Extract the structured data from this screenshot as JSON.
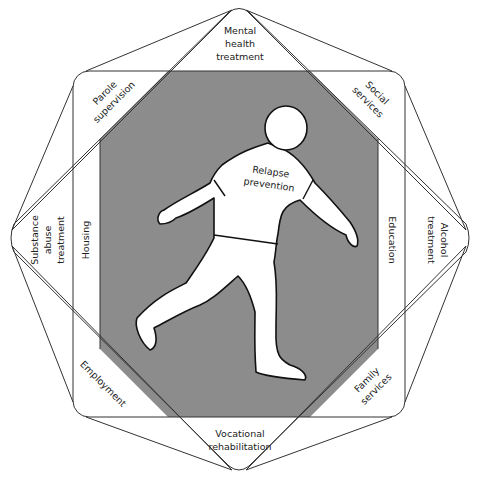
{
  "diagram": {
    "type": "concentric-service-octagon",
    "center": {
      "figure": "walking-person",
      "label_lines": [
        "Relapse",
        "prevention"
      ]
    },
    "outer_points": [
      {
        "id": "top",
        "lines": [
          "Mental",
          "health",
          "treatment"
        ]
      },
      {
        "id": "right",
        "lines": [
          "Alcohol",
          "treatment"
        ]
      },
      {
        "id": "bottom",
        "lines": [
          "Vocational",
          "rehabilitation"
        ]
      },
      {
        "id": "left",
        "lines": [
          "Substance",
          "abuse",
          "treatment"
        ]
      }
    ],
    "corners": [
      {
        "id": "top-left",
        "lines": [
          "Parole",
          "supervision"
        ]
      },
      {
        "id": "top-right",
        "lines": [
          "Social",
          "services"
        ]
      },
      {
        "id": "bottom-right",
        "lines": [
          "Family",
          "services"
        ]
      },
      {
        "id": "bottom-left",
        "lines": [
          "Employment"
        ]
      }
    ],
    "side_strips": [
      {
        "id": "left",
        "label": "Housing"
      },
      {
        "id": "right",
        "label": "Education"
      }
    ],
    "colors": {
      "background": "#ffffff",
      "center_fill": "#8c8c8c",
      "lines": "#333333",
      "text": "#222222"
    }
  }
}
